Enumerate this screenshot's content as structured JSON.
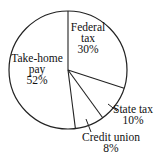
{
  "chart_data": {
    "type": "pie",
    "title": "",
    "start_angle_deg": 0,
    "direction": "clockwise",
    "categories": [
      "Federal tax",
      "State tax",
      "Credit union",
      "Take-home pay"
    ],
    "values": [
      30,
      10,
      8,
      52
    ],
    "unit": "%",
    "slices": [
      {
        "label_lines": [
          "Federal",
          "tax",
          "30%"
        ],
        "value": 30,
        "label_inside": true,
        "label_pos": [
          88,
          31
        ],
        "line_height": 11
      },
      {
        "label_lines": [
          "State tax",
          "10%"
        ],
        "value": 10,
        "label_inside": false,
        "label_pos": [
          133,
          113
        ],
        "line_height": 11,
        "leader": [
          [
            108,
            104
          ],
          [
            117,
            111
          ]
        ]
      },
      {
        "label_lines": [
          "Credit union",
          "8%"
        ],
        "value": 8,
        "label_inside": false,
        "label_pos": [
          111,
          141
        ],
        "line_height": 11,
        "leader": [
          [
            86,
            119
          ],
          [
            91,
            132
          ]
        ]
      },
      {
        "label_lines": [
          "Take-home",
          "pay",
          "52%"
        ],
        "value": 52,
        "label_inside": true,
        "label_pos": [
          37,
          62
        ],
        "line_height": 11
      }
    ],
    "legend": "none",
    "grid": false
  },
  "geometry": {
    "cx": 68,
    "cy": 70,
    "r": 59
  },
  "colors": {
    "stroke": "#222222",
    "fill": "#ffffff"
  }
}
